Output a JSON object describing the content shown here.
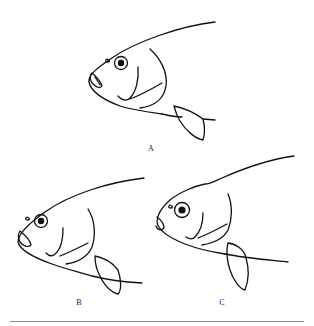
{
  "figure": {
    "panels": [
      {
        "id": "A",
        "label": "A",
        "subject": "fish head, lateral view"
      },
      {
        "id": "B",
        "label": "B",
        "subject": "fish head, lateral view"
      },
      {
        "id": "C",
        "label": "C",
        "subject": "fish head, lateral view, humped nape"
      }
    ],
    "colors": {
      "line": "#111111",
      "background": "#ffffff",
      "rule": "#888888"
    }
  }
}
